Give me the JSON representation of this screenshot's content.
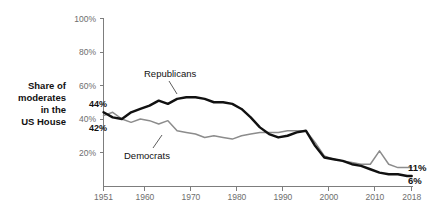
{
  "chart_data": {
    "type": "line",
    "title": "",
    "ylabel": "Share of moderates in the US House",
    "xlabel": "",
    "xlim": [
      1951,
      2018
    ],
    "ylim": [
      0,
      100
    ],
    "grid": false,
    "legend_position": "inline-annotation",
    "y_ticks": [
      "100%",
      "80%",
      "60%",
      "40%",
      "20%"
    ],
    "y_tick_values": [
      100,
      80,
      60,
      40,
      20
    ],
    "x_ticks": [
      "1951",
      "1960",
      "1970",
      "1980",
      "1990",
      "2000",
      "2010",
      "2018"
    ],
    "x_tick_values": [
      1951,
      1960,
      1970,
      1980,
      1990,
      2000,
      2010,
      2018
    ],
    "annotations": {
      "republicans_label": "Republicans",
      "democrats_label": "Democrats",
      "republicans_start": "44%",
      "democrats_start": "42%",
      "democrats_end": "11%",
      "republicans_end": "6%"
    },
    "colors": {
      "republicans": "#111111",
      "democrats": "#8c8c8c",
      "axis": "#7d7d7d",
      "tick_text": "#6e6e6e",
      "label_text": "#111111",
      "background": "#ffffff"
    },
    "x": [
      1951,
      1953,
      1955,
      1957,
      1959,
      1961,
      1963,
      1965,
      1967,
      1969,
      1971,
      1973,
      1975,
      1977,
      1979,
      1981,
      1983,
      1985,
      1987,
      1989,
      1991,
      1993,
      1995,
      1997,
      1999,
      2001,
      2003,
      2005,
      2007,
      2009,
      2011,
      2013,
      2015,
      2017,
      2018
    ],
    "series": [
      {
        "name": "Republicans",
        "color": "#111111",
        "values": [
          44,
          41,
          40,
          44,
          46,
          48,
          51,
          49,
          52,
          53,
          53,
          52,
          50,
          50,
          49,
          46,
          41,
          35,
          31,
          29,
          30,
          32,
          33,
          24,
          17,
          16,
          15,
          13,
          12,
          10,
          8,
          7,
          7,
          6,
          6
        ]
      },
      {
        "name": "Democrats",
        "color": "#8c8c8c",
        "values": [
          42,
          44,
          40,
          38,
          40,
          39,
          37,
          39,
          33,
          32,
          31,
          29,
          30,
          29,
          28,
          30,
          31,
          32,
          32,
          32,
          33,
          33,
          33,
          26,
          18,
          16,
          15,
          14,
          13,
          13,
          21,
          13,
          11,
          11,
          11
        ]
      }
    ]
  }
}
